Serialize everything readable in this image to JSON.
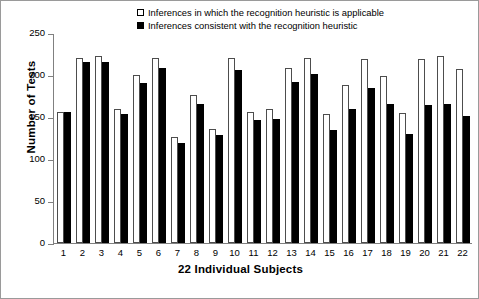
{
  "chart_data": {
    "type": "bar",
    "title": "",
    "xlabel": "22 Individual Subjects",
    "ylabel": "Number of Tests",
    "categories": [
      "1",
      "2",
      "3",
      "4",
      "5",
      "6",
      "7",
      "8",
      "9",
      "10",
      "11",
      "12",
      "13",
      "14",
      "15",
      "16",
      "17",
      "18",
      "19",
      "20",
      "21",
      "22"
    ],
    "series": [
      {
        "name": "Inferences in which the recognition heuristic is applicable",
        "swatch": "open",
        "color": "#ffffff",
        "values": [
          156,
          220,
          223,
          160,
          200,
          220,
          126,
          176,
          136,
          220,
          156,
          160,
          208,
          220,
          153,
          188,
          219,
          199,
          155,
          219,
          223,
          207
        ]
      },
      {
        "name": "Inferences consistent with the recognition heuristic",
        "swatch": "filled",
        "color": "#000000",
        "values": [
          156,
          216,
          216,
          154,
          191,
          208,
          119,
          165,
          128,
          206,
          146,
          148,
          192,
          201,
          134,
          159,
          185,
          166,
          130,
          164,
          165,
          151
        ]
      }
    ],
    "ylim": [
      0,
      250
    ],
    "yticks": [
      0,
      50,
      100,
      150,
      200,
      250
    ],
    "grid": false,
    "legend_position": "top-center"
  }
}
